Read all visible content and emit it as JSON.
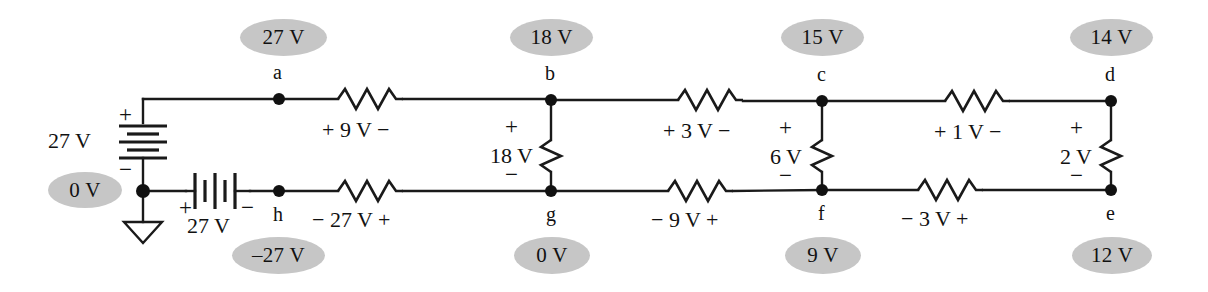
{
  "figure": {
    "type": "circuit-diagram"
  },
  "node_labels": [
    {
      "id": "a",
      "text": "a"
    },
    {
      "id": "b",
      "text": "b"
    },
    {
      "id": "c",
      "text": "c"
    },
    {
      "id": "d",
      "text": "d"
    },
    {
      "id": "e",
      "text": "e"
    },
    {
      "id": "f",
      "text": "f"
    },
    {
      "id": "g",
      "text": "g"
    },
    {
      "id": "h",
      "text": "h"
    }
  ],
  "node_voltages": [
    {
      "node": "a",
      "text": "27 V"
    },
    {
      "node": "b",
      "text": "18 V"
    },
    {
      "node": "c",
      "text": "15 V"
    },
    {
      "node": "d",
      "text": "14 V"
    },
    {
      "node": "e",
      "text": "12 V"
    },
    {
      "node": "f",
      "text": "9 V"
    },
    {
      "node": "g",
      "text": "0 V"
    },
    {
      "node": "h",
      "text": "–27 V"
    },
    {
      "node": "ground",
      "text": "0 V"
    }
  ],
  "sources": [
    {
      "id": "vertical-source",
      "value": "27 V",
      "plus": "+",
      "minus": "−"
    },
    {
      "id": "horizontal-source",
      "value": "27 V",
      "plus": "+",
      "minus": "−"
    }
  ],
  "series_elements": [
    {
      "id": "r-ab",
      "label": "+ 9 V −"
    },
    {
      "id": "r-bc",
      "label": "+ 3 V −"
    },
    {
      "id": "r-cd",
      "label": "+ 1 V −"
    },
    {
      "id": "r-hg",
      "label": "−  27 V +"
    },
    {
      "id": "r-gf",
      "label": "− 9 V +"
    },
    {
      "id": "r-fe",
      "label": "− 3 V +"
    }
  ],
  "shunt_elements": [
    {
      "id": "r-bg",
      "value": "18 V",
      "plus": "+",
      "minus": "−"
    },
    {
      "id": "r-cf",
      "value": "6 V",
      "plus": "+",
      "minus": "−"
    },
    {
      "id": "r-de",
      "value": "2 V",
      "plus": "+",
      "minus": "−"
    }
  ],
  "colors": {
    "bubble_fill": "#c6c6c6",
    "wire": "#1a1a1a",
    "text": "#111111",
    "background": "#ffffff"
  }
}
